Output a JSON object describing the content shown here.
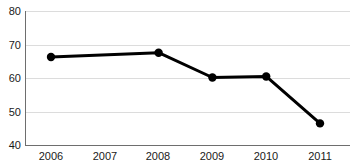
{
  "chart_data": {
    "type": "line",
    "title": "",
    "subtitle": "",
    "xlabel": "",
    "ylabel": "",
    "categories": [
      "2006",
      "2007",
      "2008",
      "2009",
      "2010",
      "2011"
    ],
    "x": [
      2006,
      2007,
      2008,
      2009,
      2010,
      2011
    ],
    "values": [
      66.4,
      null,
      67.7,
      60.3,
      60.6,
      46.6
    ],
    "series": [
      {
        "name": "",
        "values": [
          66.4,
          null,
          67.7,
          60.3,
          60.6,
          46.6
        ],
        "color": "#000000",
        "marker": "circle",
        "markers_at": [
          "2006",
          "2008",
          "2009",
          "2010",
          "2011"
        ]
      }
    ],
    "ylim": [
      40,
      80
    ],
    "yticks": [
      40,
      50,
      60,
      70,
      80
    ],
    "ytick_labels": [
      "40",
      "50",
      "60",
      "70",
      "80"
    ],
    "xticks": [
      "2006",
      "2007",
      "2008",
      "2009",
      "2010",
      "2011"
    ],
    "grid": true,
    "grid_axis": "y",
    "grid_color": "#dcdcdc",
    "legend": false,
    "legend_position": "none",
    "background": "#ffffff",
    "annotations": []
  },
  "axes": {
    "y_tick_0": "40",
    "y_tick_1": "50",
    "y_tick_2": "60",
    "y_tick_3": "70",
    "y_tick_4": "80",
    "x_tick_0": "2006",
    "x_tick_1": "2007",
    "x_tick_2": "2008",
    "x_tick_3": "2009",
    "x_tick_4": "2010",
    "x_tick_5": "2011"
  }
}
